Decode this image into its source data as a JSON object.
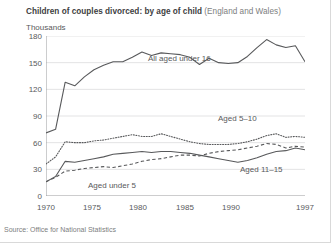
{
  "title": {
    "main": "Children of couples divorced: by age of child",
    "region": "(England and Wales)"
  },
  "axis": {
    "y_unit": "Thousands",
    "y_ticks": [
      "0",
      "30",
      "60",
      "90",
      "120",
      "150",
      "180"
    ],
    "x_ticks": [
      "1970",
      "1975",
      "1980",
      "1985",
      "1990",
      "1997"
    ]
  },
  "source": "Source: Office for National Statistics",
  "series_labels": {
    "all_under_16": "All aged under 16",
    "aged_5_10": "Aged 5–10",
    "aged_11_15": "Aged 11–15",
    "aged_under_5": "Aged under 5"
  },
  "chart_data": {
    "type": "line",
    "title": "Children of couples divorced: by age of child (England and Wales)",
    "xlabel": "",
    "ylabel": "Thousands",
    "xlim": [
      1970,
      1997
    ],
    "ylim": [
      0,
      180
    ],
    "grid": true,
    "legend": "inline-annotations",
    "x": [
      1970,
      1971,
      1972,
      1973,
      1974,
      1975,
      1976,
      1977,
      1978,
      1979,
      1980,
      1981,
      1982,
      1983,
      1984,
      1985,
      1986,
      1987,
      1988,
      1989,
      1990,
      1991,
      1992,
      1993,
      1994,
      1995,
      1996,
      1997
    ],
    "series": [
      {
        "name": "All aged under 16",
        "style": "solid",
        "values": [
          71,
          75,
          128,
          124,
          134,
          142,
          147,
          151,
          151,
          156,
          162,
          158,
          161,
          160,
          159,
          156,
          148,
          155,
          150,
          149,
          150,
          157,
          167,
          176,
          170,
          167,
          169,
          151
        ]
      },
      {
        "name": "Aged 5–10",
        "style": "dotted",
        "values": [
          36,
          44,
          61,
          60,
          60,
          62,
          63,
          65,
          67,
          69,
          67,
          67,
          70,
          67,
          64,
          61,
          59,
          58,
          58,
          58,
          59,
          61,
          64,
          68,
          70,
          66,
          67,
          66
        ]
      },
      {
        "name": "Aged 11–15",
        "style": "solid",
        "values": [
          16,
          22,
          39,
          38,
          40,
          42,
          44,
          47,
          48,
          49,
          50,
          49,
          50,
          50,
          49,
          48,
          46,
          44,
          42,
          40,
          38,
          40,
          43,
          47,
          50,
          51,
          54,
          52
        ]
      },
      {
        "name": "Aged under 5",
        "style": "dashed",
        "values": [
          16,
          21,
          28,
          29,
          31,
          32,
          33,
          32,
          34,
          36,
          39,
          41,
          42,
          44,
          46,
          46,
          45,
          48,
          50,
          51,
          52,
          54,
          56,
          59,
          58,
          54,
          56,
          55
        ]
      }
    ]
  },
  "colors": {
    "line": "#58595b",
    "grid": "#e3e3e4",
    "axis": "#9a9b9d",
    "text": "#58595b",
    "title_strong": "#404041",
    "title_light": "#7d7e80"
  }
}
